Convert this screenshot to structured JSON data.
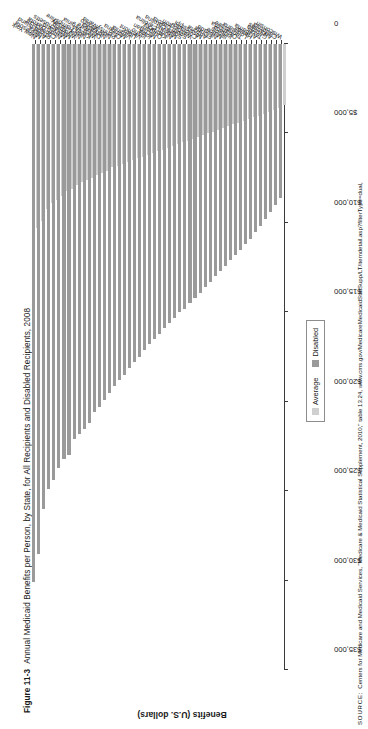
{
  "figure": {
    "number": "Figure 11-3",
    "title": "Annual Medicaid Benefits per Person, by State, for All Recipients and Disabled Recipients, 2008"
  },
  "source": {
    "label": "SOURCE:",
    "text": "Centers for Medicare and Medicaid Services, \"Medicare & Medicaid Statistical Supplement, 2010,\" table 13.24, www.cms.gov/MedicareMedicaidStatSupp/LT/itemdetail.asp?filterType=dual,"
  },
  "legend": {
    "position": "bottom-right",
    "entries": [
      {
        "label": "Average",
        "color": "#cfcfcf"
      },
      {
        "label": "Disabled",
        "color": "#9a9a9a"
      }
    ]
  },
  "chart_data": {
    "type": "bar",
    "orientation": "horizontal",
    "title": "Annual Medicaid Benefits per Person, by State, for All Recipients and Disabled Recipients, 2008",
    "xlabel": "",
    "ylabel": "Benefits (U.S. dollars)",
    "ylim": [
      0,
      35000
    ],
    "yticks": [
      0,
      5000,
      10000,
      15000,
      20000,
      25000,
      30000,
      35000
    ],
    "ytick_labels": [
      "0",
      "$5,000",
      "$10,000",
      "$15,000",
      "$20,000",
      "$25,000",
      "$30,000",
      "$35,000"
    ],
    "grid": false,
    "categories": [
      "New York",
      "Minnesota",
      "Alaska",
      "Rhode Island",
      "Connecticut",
      "North Dakota",
      "Maryland",
      "Massachusetts",
      "Wyoming",
      "New Jersey",
      "New Hampshire",
      "Kansas",
      "West Virginia",
      "Delaware",
      "Nebraska",
      "New Mexico",
      "Pennsylvania",
      "Ohio",
      "Montana",
      "Virginia",
      "Utah",
      "Vermont",
      "Idaho",
      "Iowa",
      "Michigan",
      "Oregon",
      "Kentucky",
      "North Carolina",
      "Missouri",
      "South Carolina",
      "South Dakota",
      "Washington",
      "Colorado",
      "Mississippi",
      "Arizona",
      "Florida",
      "Nevada",
      "Maine",
      "Illinois",
      "Indiana",
      "Oklahoma",
      "Tennessee",
      "Louisiana",
      "Hawaii",
      "Alabama",
      "Texas",
      "Georgia",
      "Arkansas",
      "California",
      "Wisconsin"
    ],
    "series": [
      {
        "name": "Disabled",
        "color": "#9a9a9a",
        "values": [
          30100,
          28500,
          26000,
          24900,
          24400,
          23700,
          23200,
          23000,
          22100,
          21800,
          21500,
          21200,
          20600,
          20300,
          19900,
          19500,
          19100,
          18800,
          18500,
          18100,
          17800,
          17500,
          17100,
          16800,
          16500,
          16200,
          15900,
          15600,
          15300,
          15000,
          14800,
          14500,
          14200,
          13900,
          13600,
          13300,
          13000,
          12700,
          12400,
          12100,
          11800,
          11500,
          11200,
          10900,
          10500,
          10200,
          9800,
          9400,
          9000,
          8600
        ]
      },
      {
        "name": "Average",
        "color": "#cfcfcf",
        "values": [
          10300,
          9900,
          9200,
          8900,
          8700,
          8500,
          8200,
          8100,
          7900,
          7700,
          7600,
          7500,
          7300,
          7200,
          7100,
          6900,
          6800,
          6700,
          6600,
          6500,
          6400,
          6300,
          6200,
          6100,
          6000,
          5900,
          5800,
          5700,
          5600,
          5500,
          5400,
          5300,
          5200,
          5100,
          5000,
          4900,
          4800,
          4700,
          4600,
          4500,
          4400,
          4300,
          4200,
          4100,
          4000,
          3900,
          3800,
          3700,
          3600,
          3400
        ]
      }
    ]
  }
}
